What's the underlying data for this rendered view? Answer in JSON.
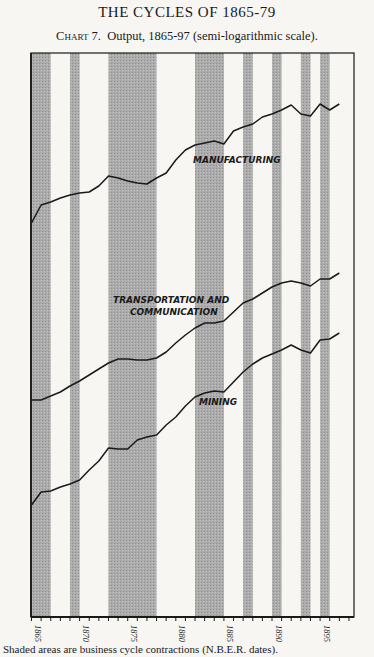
{
  "page": {
    "running_head": "THE CYCLES OF 1865-79",
    "chart_label": "Chart 7.",
    "chart_title": "Output, 1865-97 (semi-logarithmic scale).",
    "caption": "Shaded areas are business cycle contractions (N.B.E.R. dates)."
  },
  "chart_data": {
    "type": "line",
    "xlabel": "",
    "ylabel": "",
    "y_scale": "log",
    "y_ticks_labeled": false,
    "xlim": [
      1865,
      1898
    ],
    "x_ticks": [
      1865,
      1870,
      1875,
      1880,
      1885,
      1890,
      1895
    ],
    "grid": false,
    "legend": "inline labels",
    "shaded_contractions": [
      [
        1865.0,
        1867.0
      ],
      [
        1869.0,
        1870.0
      ],
      [
        1873.0,
        1878.0
      ],
      [
        1882.0,
        1885.0
      ],
      [
        1887.0,
        1888.0
      ],
      [
        1890.0,
        1891.0
      ],
      [
        1893.0,
        1894.0
      ],
      [
        1895.0,
        1896.0
      ]
    ],
    "y_units_note": "values are relative vertical positions read from the plot (higher = larger output); semi-log scale, no y-axis labels shown",
    "series": [
      {
        "name": "MANUFACTURING",
        "points": [
          [
            1865,
            223
          ],
          [
            1866,
            205
          ],
          [
            1867,
            202
          ],
          [
            1868,
            198
          ],
          [
            1869,
            195
          ],
          [
            1870,
            193
          ],
          [
            1871,
            192
          ],
          [
            1872,
            186
          ],
          [
            1873,
            176
          ],
          [
            1874,
            178
          ],
          [
            1875,
            181
          ],
          [
            1876,
            183
          ],
          [
            1877,
            184
          ],
          [
            1878,
            178
          ],
          [
            1879,
            173
          ],
          [
            1880,
            160
          ],
          [
            1881,
            150
          ],
          [
            1882,
            145
          ],
          [
            1883,
            143
          ],
          [
            1884,
            141
          ],
          [
            1885,
            144
          ],
          [
            1886,
            131
          ],
          [
            1887,
            127
          ],
          [
            1888,
            124
          ],
          [
            1889,
            117
          ],
          [
            1890,
            114
          ],
          [
            1891,
            110
          ],
          [
            1892,
            105
          ],
          [
            1893,
            114
          ],
          [
            1894,
            116
          ],
          [
            1895,
            104
          ],
          [
            1896,
            110
          ],
          [
            1897,
            104
          ]
        ]
      },
      {
        "name": "TRANSPORTATION AND COMMUNICATION",
        "points": [
          [
            1865,
            400
          ],
          [
            1866,
            400
          ],
          [
            1867,
            396
          ],
          [
            1868,
            392
          ],
          [
            1869,
            386
          ],
          [
            1870,
            381
          ],
          [
            1871,
            375
          ],
          [
            1872,
            369
          ],
          [
            1873,
            363
          ],
          [
            1874,
            359
          ],
          [
            1875,
            359
          ],
          [
            1876,
            360
          ],
          [
            1877,
            360
          ],
          [
            1878,
            358
          ],
          [
            1879,
            352
          ],
          [
            1880,
            343
          ],
          [
            1881,
            335
          ],
          [
            1882,
            328
          ],
          [
            1883,
            323
          ],
          [
            1884,
            323
          ],
          [
            1885,
            321
          ],
          [
            1886,
            312
          ],
          [
            1887,
            303
          ],
          [
            1888,
            299
          ],
          [
            1889,
            293
          ],
          [
            1890,
            287
          ],
          [
            1891,
            283
          ],
          [
            1892,
            281
          ],
          [
            1893,
            283
          ],
          [
            1894,
            286
          ],
          [
            1895,
            279
          ],
          [
            1896,
            279
          ],
          [
            1897,
            273
          ]
        ]
      },
      {
        "name": "MINING",
        "points": [
          [
            1865,
            505
          ],
          [
            1866,
            492
          ],
          [
            1867,
            491
          ],
          [
            1868,
            487
          ],
          [
            1869,
            484
          ],
          [
            1870,
            480
          ],
          [
            1871,
            470
          ],
          [
            1872,
            461
          ],
          [
            1873,
            448
          ],
          [
            1874,
            449
          ],
          [
            1875,
            449
          ],
          [
            1876,
            440
          ],
          [
            1877,
            437
          ],
          [
            1878,
            435
          ],
          [
            1879,
            425
          ],
          [
            1880,
            417
          ],
          [
            1881,
            406
          ],
          [
            1882,
            397
          ],
          [
            1883,
            393
          ],
          [
            1884,
            391
          ],
          [
            1885,
            392
          ],
          [
            1886,
            382
          ],
          [
            1887,
            372
          ],
          [
            1888,
            364
          ],
          [
            1889,
            358
          ],
          [
            1890,
            354
          ],
          [
            1891,
            350
          ],
          [
            1892,
            345
          ],
          [
            1893,
            350
          ],
          [
            1894,
            353
          ],
          [
            1895,
            340
          ],
          [
            1896,
            339
          ],
          [
            1897,
            333
          ]
        ]
      }
    ],
    "labels": [
      {
        "text": "MANUFACTURING",
        "x": 193,
        "y": 163
      },
      {
        "text": "TRANSPORTATION AND",
        "x": 113,
        "y": 303
      },
      {
        "text": "COMMUNICATION",
        "x": 130,
        "y": 315
      },
      {
        "text": "MINING",
        "x": 199,
        "y": 405
      }
    ],
    "colors": {
      "band": "#a9a9a9",
      "line": "#1a1a1a",
      "frame": "#1a1a1a",
      "paper": "#f7f6f3"
    }
  }
}
